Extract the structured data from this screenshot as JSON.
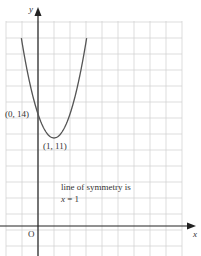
{
  "chart_data": {
    "type": "line",
    "title": "",
    "equation": "y = 3x^2 - 6x + 14",
    "xlabel": "x",
    "ylabel": "y",
    "origin_label": "O",
    "xlim": [
      -2,
      9
    ],
    "ylim": [
      -4,
      25
    ],
    "grid": true,
    "grid_spacing": {
      "x": 1,
      "y": 2
    },
    "series": [
      {
        "name": "parabola",
        "x": [
          -1.04,
          -0.5,
          0,
          0.5,
          1,
          1.5,
          2,
          2.5,
          3.04
        ],
        "y": [
          23.5,
          20.75,
          14,
          11.75,
          11,
          11.75,
          14,
          17.75,
          23.5
        ]
      }
    ],
    "annotations": [
      {
        "text": "(0, 14)",
        "x": 0,
        "y": 14
      },
      {
        "text": "(1, 11)",
        "x": 1,
        "y": 11
      },
      {
        "text": "line of symmetry is",
        "x": 2.2,
        "y": 5
      },
      {
        "text": "x = 1",
        "x": 2.2,
        "y": 3
      }
    ],
    "colors": {
      "curve": "#555555",
      "axes": "#222222",
      "grid": "#cccccc"
    }
  },
  "labels": {
    "y_axis": "y",
    "x_axis": "x",
    "origin": "O",
    "intercept": "(0, 14)",
    "vertex": "(1, 11)",
    "symmetry_line1": "line of symmetry is",
    "symmetry_line2_var": "x",
    "symmetry_line2_rest": " = 1"
  }
}
